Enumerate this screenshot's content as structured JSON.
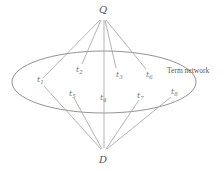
{
  "diagram": {
    "type": "query-document term network",
    "nodes": {
      "query": {
        "label": "Q",
        "x": 103,
        "y": 13
      },
      "document": {
        "label": "D",
        "x": 103,
        "y": 158
      }
    },
    "network_label": "Term network",
    "terms": [
      {
        "id": "t1",
        "label": "t",
        "sub": "1",
        "x": 40,
        "y": 82
      },
      {
        "id": "t2",
        "label": "t",
        "sub": "2",
        "x": 78,
        "y": 71
      },
      {
        "id": "t3",
        "label": "t",
        "sub": "3",
        "x": 117,
        "y": 76
      },
      {
        "id": "t6",
        "label": "t",
        "sub": "6",
        "x": 147,
        "y": 77
      },
      {
        "id": "t5",
        "label": "t",
        "sub": "5",
        "x": 70,
        "y": 95
      },
      {
        "id": "t4",
        "label": "t",
        "sub": "4",
        "x": 101,
        "y": 100
      },
      {
        "id": "t7",
        "label": "t",
        "sub": "7",
        "x": 138,
        "y": 97
      },
      {
        "id": "t8",
        "label": "t",
        "sub": "8",
        "x": 172,
        "y": 94
      }
    ],
    "query_edges": [
      "t1",
      "t2",
      "t4",
      "t3",
      "t6"
    ],
    "document_edges": [
      "t1",
      "t5",
      "t4",
      "t7",
      "t8"
    ],
    "colors": {
      "edge": "#aaaaaa",
      "ellipse": "#777777",
      "text": "#555555"
    }
  }
}
